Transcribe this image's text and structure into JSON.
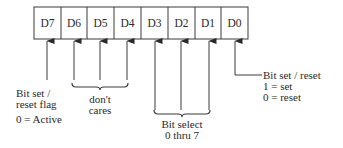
{
  "diagram": {
    "register_cells": [
      "D7",
      "D6",
      "D5",
      "D4",
      "D3",
      "D2",
      "D1",
      "D0"
    ],
    "annotations": {
      "d7": {
        "lines": [
          "Bit set /",
          "reset flag",
          "0 = Active"
        ]
      },
      "d6_d4": {
        "lines": [
          "don't",
          "cares"
        ]
      },
      "d3_d1": {
        "lines": [
          "Bit select",
          "0 thru 7"
        ]
      },
      "d0": {
        "lines": [
          "Bit set / reset",
          "1 = set",
          "0 = reset"
        ]
      }
    },
    "colors": {
      "stroke": "#3a3a3a",
      "text": "#2a2a2a",
      "background": "#ffffff"
    }
  }
}
